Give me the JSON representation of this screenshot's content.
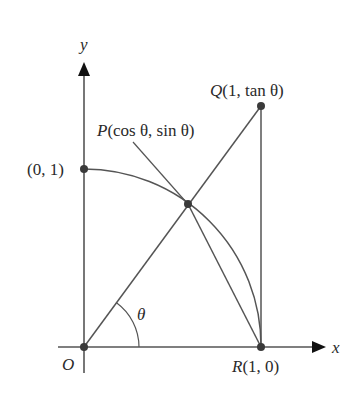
{
  "diagram": {
    "axes": {
      "x_label": "x",
      "y_label": "y"
    },
    "points": {
      "origin": {
        "label": "O"
      },
      "y_intercept": {
        "label": "(0, 1)"
      },
      "P": {
        "name": "P",
        "coords": "(cos θ, sin θ)"
      },
      "Q": {
        "name": "Q",
        "coords": "(1, tan θ)"
      },
      "R": {
        "name": "R",
        "coords": "(1, 0)"
      }
    },
    "angle_label": "θ",
    "colors": {
      "line": "#555555",
      "point": "#3a3a3a",
      "text": "#2a2a2a"
    }
  }
}
